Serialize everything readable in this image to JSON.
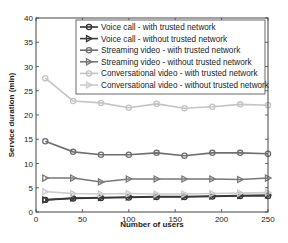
{
  "chart_data": {
    "type": "line",
    "title": "",
    "xlabel": "Number of users",
    "ylabel": "Service duration (min)",
    "xlim": [
      0,
      250
    ],
    "ylim": [
      0,
      40
    ],
    "x_ticks": [
      0,
      50,
      100,
      150,
      200,
      250
    ],
    "y_ticks": [
      0,
      5,
      10,
      15,
      20,
      25,
      30,
      35,
      40
    ],
    "grid": false,
    "legend_position": "upper right",
    "x": [
      10,
      40,
      70,
      100,
      130,
      160,
      190,
      220,
      250
    ],
    "series": [
      {
        "name": "Voice call - with trusted network",
        "color": "#333333",
        "marker": "circle",
        "values": [
          2.5,
          2.8,
          2.9,
          3.0,
          3.1,
          3.1,
          3.2,
          3.3,
          3.3
        ]
      },
      {
        "name": "Voice call - without trusted network",
        "color": "#3a3a3a",
        "marker": "triangle-right",
        "values": [
          2.5,
          2.9,
          3.0,
          3.1,
          3.2,
          3.2,
          3.3,
          3.4,
          3.5
        ]
      },
      {
        "name": "Streaming video - with trusted network",
        "color": "#6e6e6e",
        "marker": "circle",
        "values": [
          14.6,
          12.4,
          11.8,
          11.8,
          12.2,
          11.6,
          12.2,
          12.2,
          12.0
        ]
      },
      {
        "name": "Streaming video - without trusted network",
        "color": "#777777",
        "marker": "triangle-right",
        "values": [
          7.0,
          7.0,
          6.2,
          6.8,
          6.8,
          6.8,
          6.8,
          6.7,
          7.0
        ]
      },
      {
        "name": "Conversational video - with trusted network",
        "color": "#c4c4c4",
        "marker": "circle",
        "values": [
          27.6,
          22.9,
          22.5,
          21.5,
          22.3,
          21.4,
          21.7,
          22.2,
          22.0
        ]
      },
      {
        "name": "Conversational video - without trusted network",
        "color": "#cccccc",
        "marker": "triangle-right",
        "values": [
          4.2,
          3.8,
          3.7,
          3.8,
          3.7,
          3.7,
          3.8,
          3.9,
          4.0
        ]
      }
    ]
  }
}
